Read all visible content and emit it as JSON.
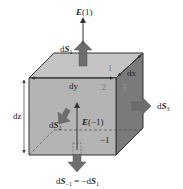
{
  "diagram": {
    "labels": {
      "e_top": {
        "bold": "E",
        "rest": "(1)"
      },
      "e_bottom": {
        "bold": "E",
        "rest": "(−1)"
      },
      "ds1": {
        "prefix": "d",
        "bold": "S",
        "sub": "1"
      },
      "ds2": {
        "prefix": "d",
        "bold": "S",
        "sub": "2"
      },
      "ds3": {
        "prefix": "d",
        "bold": "S",
        "sub": "3"
      },
      "ds_minus1": {
        "prefix": "d",
        "bold": "S",
        "sub": "−1",
        "eq": " = −d",
        "bold2": "S",
        "sub2": "1"
      },
      "dx": "dx",
      "dy": "dy",
      "dz": "dz",
      "face_1": "1",
      "face_2": "2",
      "face_3": "3",
      "face_minus1": "−1"
    },
    "colors": {
      "front_face": "#b4b4b4",
      "top_face": "#c4c4c4",
      "right_face": "#7a7a7a",
      "edge": "#333333",
      "arrow_fill": "#6e6e6e",
      "text": "#222222"
    }
  }
}
